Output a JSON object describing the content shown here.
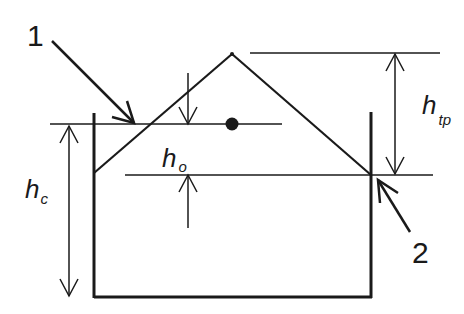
{
  "diagram": {
    "type": "vessel cross-section with cone-shaped mound and dimension arrows",
    "colors": {
      "stroke": "#1a1a1a",
      "background": "#ffffff"
    },
    "callouts": [
      {
        "id": "1",
        "label": "1",
        "points_to": "intersection of mound slope with fill level line"
      },
      {
        "id": "2",
        "label": "2",
        "points_to": "junction of mound slope with right vessel wall"
      }
    ],
    "dimensions": {
      "h_c": {
        "main": "h",
        "sub": "c",
        "meaning": "height from vessel bottom to level line"
      },
      "h_o": {
        "main": "h",
        "sub": "o",
        "meaning": "offset between level line and slope/wall junction"
      },
      "h_tp": {
        "main": "h",
        "sub": "tp",
        "meaning": "height from slope/wall junction to apex"
      }
    },
    "elements": [
      "vessel (open-top rectangle)",
      "triangular mound (apex above vessel)",
      "horizontal level line with center dot",
      "horizontal apex reference line",
      "horizontal wall-junction reference line"
    ]
  }
}
